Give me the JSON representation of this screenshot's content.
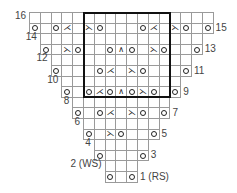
{
  "chart_data": {
    "type": "knitting-chart",
    "title": "",
    "columns": 17,
    "rows": 16,
    "symbols": {
      "o": "yarn-over",
      "k2tog": "k2tog (right-leaning decrease)",
      "ssk": "ssk (left-leaning decrease)",
      "s2kp": "centered double decrease",
      "": "knit"
    },
    "glyphs": {
      "k2tog": "⋌",
      "ssk": "⋋",
      "s2kp": "∧"
    },
    "repeat_box": {
      "col_start": 6,
      "col_end": 13,
      "row_start": 9,
      "row_end": 16
    },
    "row_list": [
      {
        "row": 16,
        "label": "16",
        "side": "left",
        "start": 1,
        "end": 17,
        "cells": {}
      },
      {
        "row": 15,
        "label": "15",
        "side": "right",
        "start": 1,
        "end": 17,
        "cells": {
          "1": "o",
          "3": "o",
          "4": "k2tog",
          "6": "ssk",
          "7": "o",
          "11": "o",
          "12": "k2tog",
          "14": "ssk",
          "15": "o",
          "17": "o"
        }
      },
      {
        "row": 14,
        "label": "14",
        "side": "left",
        "start": 2,
        "end": 16,
        "cells": {}
      },
      {
        "row": 13,
        "label": "13",
        "side": "right",
        "start": 2,
        "end": 16,
        "cells": {
          "2": "o",
          "4": "ssk",
          "5": "o",
          "8": "o",
          "9": "s2kp",
          "10": "o",
          "12": "ssk",
          "13": "o",
          "16": "o"
        }
      },
      {
        "row": 12,
        "label": "12",
        "side": "left",
        "start": 3,
        "end": 15,
        "cells": {}
      },
      {
        "row": 11,
        "label": "11",
        "side": "right",
        "start": 3,
        "end": 15,
        "cells": {
          "3": "o",
          "7": "o",
          "8": "k2tog",
          "10": "ssk",
          "11": "o",
          "15": "o"
        }
      },
      {
        "row": 10,
        "label": "10",
        "side": "left",
        "start": 4,
        "end": 14,
        "cells": {}
      },
      {
        "row": 9,
        "label": "9",
        "side": "right",
        "start": 4,
        "end": 14,
        "cells": {
          "4": "o",
          "6": "o",
          "7": "k2tog",
          "8": "o",
          "9": "s2kp",
          "10": "o",
          "11": "ssk",
          "12": "o",
          "14": "o"
        }
      },
      {
        "row": 8,
        "label": "8",
        "side": "left",
        "start": 5,
        "end": 13,
        "cells": {}
      },
      {
        "row": 7,
        "label": "7",
        "side": "right",
        "start": 5,
        "end": 13,
        "cells": {
          "5": "o",
          "7": "o",
          "8": "k2tog",
          "10": "ssk",
          "11": "o",
          "13": "o"
        }
      },
      {
        "row": 6,
        "label": "6",
        "side": "left",
        "start": 6,
        "end": 12,
        "cells": {}
      },
      {
        "row": 5,
        "label": "5",
        "side": "right",
        "start": 6,
        "end": 12,
        "cells": {
          "6": "o",
          "8": "ssk",
          "9": "o",
          "12": "o"
        }
      },
      {
        "row": 4,
        "label": "4",
        "side": "left",
        "start": 7,
        "end": 11,
        "cells": {}
      },
      {
        "row": 3,
        "label": "3",
        "side": "right",
        "start": 7,
        "end": 11,
        "cells": {
          "7": "o",
          "11": "o"
        }
      },
      {
        "row": 2,
        "label": "2 (WS)",
        "side": "left",
        "start": 8,
        "end": 10,
        "cells": {}
      },
      {
        "row": 1,
        "label": "1 (RS)",
        "side": "right",
        "start": 8,
        "end": 10,
        "cells": {
          "8": "o",
          "10": "o"
        }
      }
    ]
  }
}
